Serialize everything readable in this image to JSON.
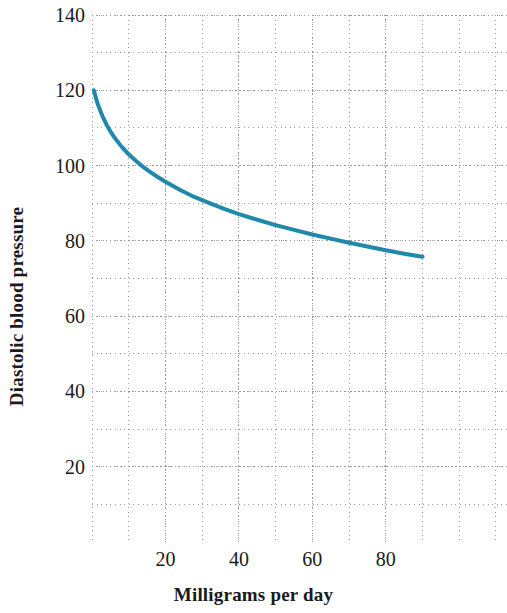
{
  "chart_data": {
    "type": "line",
    "title": "",
    "xlabel": "Milligrams per day",
    "ylabel": "Diastolic blood pressure",
    "xlim": [
      0,
      113
    ],
    "ylim": [
      0,
      140
    ],
    "x_ticks": [
      20,
      40,
      60,
      80
    ],
    "y_ticks": [
      20,
      40,
      60,
      80,
      100,
      120,
      140
    ],
    "x_minor_step": 10,
    "y_minor_step": 10,
    "grid": "dotted",
    "grid_color": "#9a9a9a",
    "legend": "none",
    "line_color": "#2089ab",
    "line_width": 4,
    "series": [
      {
        "name": "Diastolic blood pressure vs. dose",
        "x": [
          0.5,
          1,
          1.5,
          2,
          3,
          4,
          5,
          6,
          8,
          10,
          12,
          14,
          16,
          18,
          20,
          24,
          28,
          32,
          36,
          40,
          45,
          50,
          55,
          60,
          65,
          70,
          75,
          80,
          85,
          90
        ],
        "y": [
          120,
          118.2,
          116.6,
          115.2,
          112.8,
          110.8,
          109.1,
          107.6,
          105.1,
          103.0,
          101.2,
          99.6,
          98.2,
          96.9,
          95.7,
          93.5,
          91.6,
          90.0,
          88.5,
          87.1,
          85.6,
          84.2,
          82.9,
          81.7,
          80.6,
          79.5,
          78.5,
          77.5,
          76.6,
          75.8
        ]
      }
    ]
  },
  "axes": {
    "y_tick_labels": [
      "140",
      "120",
      "100",
      "80",
      "60",
      "40",
      "20"
    ],
    "x_tick_labels": [
      "20",
      "40",
      "60",
      "80"
    ],
    "y_title": "Diastolic blood pressure",
    "x_title": "Milligrams per day"
  }
}
